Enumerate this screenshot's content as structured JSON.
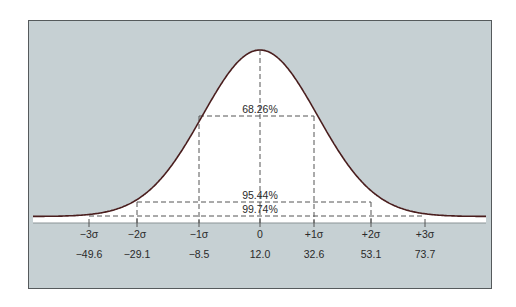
{
  "chart_data": {
    "type": "area",
    "title": "",
    "subtitle": "",
    "xlabel": "",
    "ylabel": "",
    "grid": false,
    "legend": null,
    "distribution": "normal",
    "mean": 12.0,
    "sigma_approx": 20.55,
    "sigma_labels": [
      "−3σ",
      "−2σ",
      "−1σ",
      "0",
      "+1σ",
      "+2σ",
      "+3σ"
    ],
    "value_labels": [
      "−49.6",
      "−29.1",
      "−8.5",
      "12.0",
      "32.6",
      "53.1",
      "73.7"
    ],
    "x": [
      -49.6,
      -29.1,
      -8.5,
      12.0,
      32.6,
      53.1,
      73.7
    ],
    "annotations": [
      {
        "text": "68.26%",
        "range": [
          "−1σ",
          "+1σ"
        ]
      },
      {
        "text": "95.44%",
        "range": [
          "−2σ",
          "+2σ"
        ]
      },
      {
        "text": "99.74%",
        "range": [
          "−3σ",
          "+3σ"
        ]
      }
    ],
    "colors": {
      "background": "#c6d0d3",
      "curve": "#4a1e1e",
      "fill": "#ffffff",
      "dash": "#555555",
      "frame": "#555a5c"
    }
  }
}
